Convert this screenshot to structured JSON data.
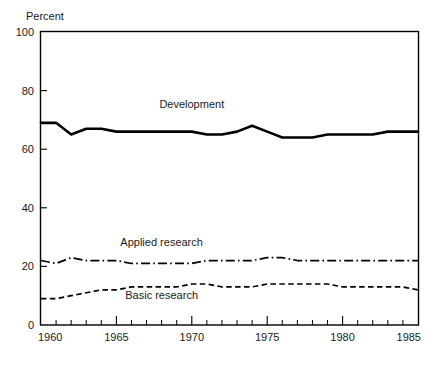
{
  "chart_data": {
    "type": "line",
    "title": "",
    "subtitle": "",
    "xlabel": "",
    "ylabel": "Percent",
    "ylabel_position": "above-axis-top-left",
    "xlim": [
      1960,
      1985
    ],
    "ylim": [
      0,
      100
    ],
    "grid": false,
    "legend": "inline-annotations",
    "y_ticks": [
      0,
      20,
      40,
      60,
      80,
      100
    ],
    "y_tick_labels": [
      "0",
      "20",
      "40",
      "60",
      "80",
      "100"
    ],
    "x_ticks_major": [
      1960,
      1965,
      1970,
      1975,
      1980,
      1985
    ],
    "x_tick_labels": [
      "1960",
      "1965",
      "1970",
      "1975",
      "1980",
      "1985"
    ],
    "x_ticks_minor_step": 1,
    "x": [
      1960,
      1961,
      1962,
      1963,
      1964,
      1965,
      1966,
      1967,
      1968,
      1969,
      1970,
      1971,
      1972,
      1973,
      1974,
      1975,
      1976,
      1977,
      1978,
      1979,
      1980,
      1981,
      1982,
      1983,
      1984,
      1985
    ],
    "series": [
      {
        "name": "Development",
        "style": "solid",
        "label_x": 1970,
        "label_y": 74,
        "values": [
          69,
          69,
          65,
          67,
          67,
          66,
          66,
          66,
          66,
          66,
          66,
          65,
          65,
          66,
          68,
          66,
          64,
          64,
          64,
          65,
          65,
          65,
          65,
          66,
          66,
          66
        ]
      },
      {
        "name": "Applied research",
        "style": "dash-dot",
        "label_x": 1968,
        "label_y": 27,
        "values": [
          22,
          21,
          23,
          22,
          22,
          22,
          21,
          21,
          21,
          21,
          21,
          22,
          22,
          22,
          22,
          23,
          23,
          22,
          22,
          22,
          22,
          22,
          22,
          22,
          22,
          22
        ]
      },
      {
        "name": "Basic research",
        "style": "dashed",
        "label_x": 1968,
        "label_y": 9,
        "values": [
          9,
          9,
          10,
          11,
          12,
          12,
          13,
          13,
          13,
          13,
          14,
          14,
          13,
          13,
          13,
          14,
          14,
          14,
          14,
          14,
          13,
          13,
          13,
          13,
          13,
          12
        ]
      }
    ]
  },
  "colors": {
    "ink": "#000000",
    "background": "#ffffff"
  },
  "axes": {
    "y_axis_title": "Percent"
  }
}
